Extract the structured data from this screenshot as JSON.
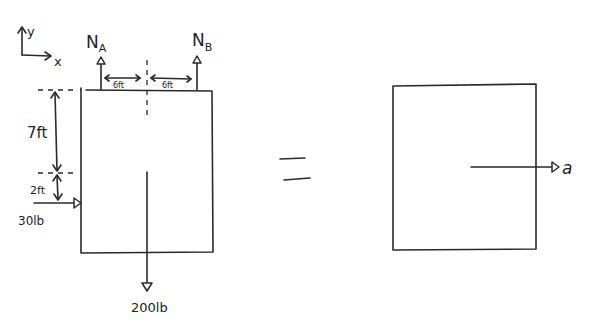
{
  "diagram": {
    "type": "free-body and kinetic diagram",
    "axes": {
      "y_label": "y",
      "x_label": "x"
    },
    "free_body": {
      "reactions": [
        {
          "label": "N",
          "subscript": "A",
          "direction": "up"
        },
        {
          "label": "N",
          "subscript": "B",
          "direction": "up"
        }
      ],
      "horizontal_dims": [
        {
          "label": "6ft"
        },
        {
          "label": "6ft"
        }
      ],
      "vertical_dims": [
        {
          "label": "7ft"
        },
        {
          "label": "2ft"
        }
      ],
      "applied_force": {
        "label": "30lb",
        "direction": "right"
      },
      "weight": {
        "label": "200lb",
        "direction": "down"
      }
    },
    "equals_sign": "=",
    "kinetic": {
      "acceleration": {
        "label": "a",
        "direction": "right"
      }
    }
  }
}
